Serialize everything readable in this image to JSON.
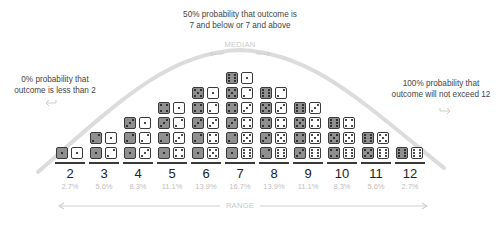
{
  "notes": {
    "median_note": [
      "50% probability that outcome is",
      "7 and below or 7 and above"
    ],
    "median_label": "MEDIAN",
    "min_note": [
      "0% probability that",
      "outcome is less than 2"
    ],
    "max_note": [
      "100% probability that",
      "outcome will not exceed 12"
    ],
    "range_label": "RANGE"
  },
  "colors": {
    "gray_die": "#8f8f8f",
    "white_die": "#ffffff",
    "outline": "#3a3a3a",
    "curve": "#d9d9d9",
    "faint_text": "#c0c0c0"
  },
  "columns": [
    {
      "sum": "2",
      "pct": "2.7%",
      "pairs": [
        [
          1,
          1
        ]
      ]
    },
    {
      "sum": "3",
      "pct": "5.6%",
      "pairs": [
        [
          1,
          2
        ],
        [
          2,
          1
        ]
      ]
    },
    {
      "sum": "4",
      "pct": "8.3%",
      "pairs": [
        [
          1,
          3
        ],
        [
          2,
          2
        ],
        [
          3,
          1
        ]
      ]
    },
    {
      "sum": "5",
      "pct": "11.1%",
      "pairs": [
        [
          1,
          4
        ],
        [
          2,
          3
        ],
        [
          3,
          2
        ],
        [
          4,
          1
        ]
      ]
    },
    {
      "sum": "6",
      "pct": "13.9%",
      "pairs": [
        [
          1,
          5
        ],
        [
          2,
          4
        ],
        [
          3,
          3
        ],
        [
          4,
          2
        ],
        [
          5,
          1
        ]
      ]
    },
    {
      "sum": "7",
      "pct": "16.7%",
      "pairs": [
        [
          1,
          6
        ],
        [
          2,
          5
        ],
        [
          3,
          4
        ],
        [
          4,
          3
        ],
        [
          5,
          2
        ],
        [
          6,
          1
        ]
      ]
    },
    {
      "sum": "8",
      "pct": "13.9%",
      "pairs": [
        [
          2,
          6
        ],
        [
          3,
          5
        ],
        [
          4,
          4
        ],
        [
          5,
          3
        ],
        [
          6,
          2
        ]
      ]
    },
    {
      "sum": "9",
      "pct": "11.1%",
      "pairs": [
        [
          3,
          6
        ],
        [
          4,
          5
        ],
        [
          5,
          4
        ],
        [
          6,
          3
        ]
      ]
    },
    {
      "sum": "10",
      "pct": "8.3%",
      "pairs": [
        [
          4,
          6
        ],
        [
          5,
          5
        ],
        [
          6,
          4
        ]
      ]
    },
    {
      "sum": "11",
      "pct": "5.6%",
      "pairs": [
        [
          5,
          6
        ],
        [
          6,
          5
        ]
      ]
    },
    {
      "sum": "12",
      "pct": "2.7%",
      "pairs": [
        [
          6,
          6
        ]
      ]
    }
  ]
}
